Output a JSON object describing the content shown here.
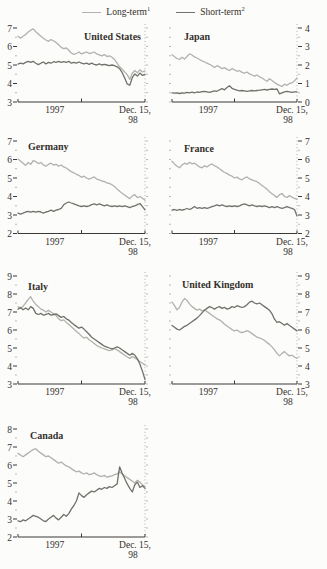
{
  "page": {
    "background": "#fcfcfa"
  },
  "legend": {
    "items": [
      {
        "label": "Long-term",
        "footnote": "1",
        "color": "#b2b1ae"
      },
      {
        "label": "Short-term",
        "footnote": "2",
        "color": "#72706b"
      }
    ]
  },
  "axis_labels": {
    "start": "1997",
    "end_line1": "Dec. 15,",
    "end_line2": "98"
  },
  "colors": {
    "long_term_line": "#b2b1ae",
    "short_term_line": "#72706b",
    "axis": "#3c3936",
    "dotted_guide": "#a8a7a4",
    "text": "#34302c"
  },
  "chart_data": [
    {
      "type": "line",
      "title": "United States",
      "axis_side": "left",
      "ylim": [
        3,
        7
      ],
      "yticks": [
        3,
        4,
        5,
        6,
        7
      ],
      "x_range": [
        "1997",
        "Dec. 15, 98"
      ],
      "series": [
        {
          "name": "Long-term",
          "values": [
            6.55,
            6.45,
            6.55,
            6.65,
            6.78,
            6.88,
            6.95,
            6.8,
            6.68,
            6.55,
            6.45,
            6.35,
            6.28,
            6.38,
            6.3,
            6.22,
            6.1,
            5.95,
            5.88,
            5.92,
            5.8,
            5.65,
            5.58,
            5.62,
            5.7,
            5.6,
            5.66,
            5.7,
            5.62,
            5.66,
            5.7,
            5.6,
            5.55,
            5.5,
            5.56,
            5.46,
            5.5,
            5.42,
            5.3,
            5.1,
            4.9,
            4.78,
            4.62,
            4.48,
            4.22,
            4.55,
            4.7,
            4.58,
            4.74,
            4.62,
            4.68
          ]
        },
        {
          "name": "Short-term",
          "values": [
            5.05,
            5.1,
            5.06,
            5.14,
            5.2,
            5.14,
            5.2,
            5.1,
            5.02,
            5.1,
            5.16,
            5.06,
            5.14,
            5.1,
            5.18,
            5.14,
            5.2,
            5.14,
            5.18,
            5.14,
            5.2,
            5.1,
            5.14,
            5.1,
            5.16,
            5.1,
            5.06,
            5.1,
            5.04,
            5.1,
            5.04,
            5.0,
            5.06,
            5.0,
            5.04,
            5.0,
            4.96,
            5.0,
            4.96,
            4.9,
            4.8,
            4.6,
            4.3,
            3.98,
            3.9,
            4.32,
            4.52,
            4.4,
            4.56,
            4.44,
            4.5
          ]
        }
      ]
    },
    {
      "type": "line",
      "title": "Japan",
      "axis_side": "right",
      "ylim": [
        0,
        4
      ],
      "yticks": [
        0,
        1,
        2,
        3,
        4
      ],
      "x_range": [
        "1997",
        "Dec. 15, 98"
      ],
      "series": [
        {
          "name": "Long-term",
          "values": [
            2.55,
            2.45,
            2.35,
            2.3,
            2.42,
            2.32,
            2.46,
            2.6,
            2.54,
            2.44,
            2.38,
            2.3,
            2.22,
            2.16,
            2.1,
            2.04,
            1.96,
            1.86,
            1.96,
            1.9,
            1.8,
            1.86,
            1.76,
            1.7,
            1.8,
            1.74,
            1.66,
            1.7,
            1.6,
            1.56,
            1.62,
            1.52,
            1.46,
            1.4,
            1.46,
            1.36,
            1.3,
            1.2,
            1.12,
            1.26,
            1.16,
            1.06,
            0.96,
            0.9,
            0.84,
            0.96,
            0.9,
            1.0,
            1.04,
            1.14,
            1.3
          ]
        },
        {
          "name": "Short-term",
          "values": [
            0.5,
            0.48,
            0.5,
            0.46,
            0.5,
            0.48,
            0.52,
            0.5,
            0.53,
            0.5,
            0.54,
            0.52,
            0.56,
            0.58,
            0.55,
            0.52,
            0.56,
            0.6,
            0.58,
            0.66,
            0.72,
            0.66,
            0.78,
            0.88,
            0.74,
            0.68,
            0.64,
            0.6,
            0.62,
            0.6,
            0.58,
            0.6,
            0.62,
            0.6,
            0.62,
            0.64,
            0.66,
            0.68,
            0.65,
            0.68,
            0.7,
            0.68,
            0.7,
            0.44,
            0.5,
            0.55,
            0.58,
            0.55,
            0.52,
            0.55,
            0.55
          ]
        }
      ]
    },
    {
      "type": "line",
      "title": "Germany",
      "axis_side": "left",
      "ylim": [
        2,
        7
      ],
      "yticks": [
        2,
        3,
        4,
        5,
        6,
        7
      ],
      "x_range": [
        "1997",
        "Dec. 15, 98"
      ],
      "series": [
        {
          "name": "Long-term",
          "values": [
            6.02,
            5.92,
            5.8,
            5.68,
            5.84,
            5.74,
            5.94,
            5.88,
            5.78,
            5.84,
            5.7,
            5.64,
            5.74,
            5.8,
            5.7,
            5.74,
            5.64,
            5.7,
            5.6,
            5.54,
            5.44,
            5.34,
            5.28,
            5.2,
            5.14,
            5.04,
            5.1,
            5.0,
            4.94,
            5.0,
            5.06,
            4.94,
            4.9,
            4.84,
            4.8,
            4.74,
            4.7,
            4.64,
            4.54,
            4.4,
            4.28,
            4.18,
            4.08,
            3.98,
            3.88,
            4.04,
            4.1,
            3.94,
            4.0,
            3.9,
            3.8
          ]
        },
        {
          "name": "Short-term",
          "values": [
            3.1,
            3.05,
            3.1,
            3.16,
            3.2,
            3.15,
            3.2,
            3.15,
            3.2,
            3.16,
            3.1,
            3.16,
            3.2,
            3.26,
            3.2,
            3.26,
            3.3,
            3.36,
            3.55,
            3.65,
            3.7,
            3.65,
            3.6,
            3.55,
            3.5,
            3.46,
            3.5,
            3.46,
            3.5,
            3.56,
            3.6,
            3.55,
            3.6,
            3.55,
            3.5,
            3.55,
            3.5,
            3.46,
            3.5,
            3.46,
            3.5,
            3.45,
            3.5,
            3.45,
            3.4,
            3.46,
            3.5,
            3.56,
            3.62,
            3.45,
            3.28
          ]
        }
      ]
    },
    {
      "type": "line",
      "title": "France",
      "axis_side": "right",
      "ylim": [
        2,
        7
      ],
      "yticks": [
        2,
        3,
        4,
        5,
        6,
        7
      ],
      "x_range": [
        "1997",
        "Dec. 15, 98"
      ],
      "series": [
        {
          "name": "Long-term",
          "values": [
            5.9,
            5.76,
            5.64,
            5.55,
            5.7,
            5.8,
            5.74,
            5.85,
            5.76,
            5.8,
            5.7,
            5.6,
            5.55,
            5.66,
            5.6,
            5.7,
            5.76,
            5.66,
            5.6,
            5.5,
            5.4,
            5.3,
            5.25,
            5.15,
            5.1,
            5.0,
            5.05,
            4.95,
            4.9,
            5.0,
            5.06,
            4.95,
            4.9,
            4.85,
            4.8,
            4.7,
            4.6,
            4.5,
            4.4,
            4.26,
            4.15,
            4.05,
            3.95,
            4.1,
            4.16,
            4.0,
            3.95,
            4.05,
            3.96,
            3.9,
            3.85
          ]
        },
        {
          "name": "Short-term",
          "values": [
            3.26,
            3.3,
            3.25,
            3.3,
            3.26,
            3.3,
            3.35,
            3.3,
            3.36,
            3.46,
            3.36,
            3.4,
            3.36,
            3.4,
            3.36,
            3.4,
            3.45,
            3.5,
            3.55,
            3.5,
            3.55,
            3.5,
            3.46,
            3.5,
            3.46,
            3.5,
            3.46,
            3.5,
            3.56,
            3.6,
            3.55,
            3.5,
            3.55,
            3.5,
            3.46,
            3.5,
            3.46,
            3.5,
            3.45,
            3.4,
            3.45,
            3.4,
            3.45,
            3.4,
            3.36,
            3.4,
            3.45,
            3.4,
            3.36,
            3.3,
            2.95
          ]
        }
      ]
    },
    {
      "type": "line",
      "title": "Italy",
      "axis_side": "left",
      "ylim": [
        3,
        9
      ],
      "yticks": [
        3,
        4,
        5,
        6,
        7,
        8,
        9
      ],
      "x_range": [
        "1997",
        "Dec. 15, 98"
      ],
      "series": [
        {
          "name": "Long-term",
          "values": [
            7.3,
            7.2,
            7.32,
            7.5,
            7.7,
            7.85,
            7.6,
            7.42,
            7.3,
            7.16,
            7.1,
            7.0,
            7.1,
            7.0,
            6.9,
            6.8,
            6.62,
            6.52,
            6.56,
            6.42,
            6.3,
            6.18,
            6.05,
            5.92,
            5.8,
            5.66,
            5.55,
            5.6,
            5.46,
            5.36,
            5.25,
            5.14,
            5.06,
            5.0,
            4.95,
            4.9,
            4.85,
            4.9,
            4.96,
            4.9,
            4.8,
            4.7,
            4.6,
            4.5,
            4.42,
            4.52,
            4.45,
            4.35,
            4.25,
            4.15,
            4.05
          ]
        },
        {
          "name": "Short-term",
          "values": [
            7.15,
            7.25,
            7.12,
            7.22,
            7.12,
            7.3,
            7.2,
            6.92,
            6.86,
            6.92,
            6.82,
            6.86,
            6.92,
            6.82,
            6.86,
            6.9,
            6.8,
            6.7,
            6.75,
            6.62,
            6.55,
            6.42,
            6.3,
            6.2,
            6.1,
            6.16,
            6.05,
            5.9,
            5.76,
            5.6,
            5.5,
            5.4,
            5.3,
            5.2,
            5.1,
            5.05,
            5.0,
            4.95,
            5.0,
            5.06,
            5.0,
            4.9,
            4.8,
            4.7,
            4.6,
            4.7,
            4.6,
            4.4,
            4.1,
            3.7,
            3.25
          ]
        }
      ]
    },
    {
      "type": "line",
      "title": "United Kingdom",
      "axis_side": "right",
      "ylim": [
        3,
        9
      ],
      "yticks": [
        3,
        4,
        5,
        6,
        7,
        8,
        9
      ],
      "x_range": [
        "1997",
        "Dec. 15, 98"
      ],
      "series": [
        {
          "name": "Long-term",
          "values": [
            7.55,
            7.35,
            7.12,
            7.25,
            7.55,
            7.75,
            7.65,
            7.45,
            7.3,
            7.2,
            7.1,
            7.16,
            7.06,
            7.12,
            7.02,
            6.92,
            6.82,
            6.72,
            6.62,
            6.56,
            6.46,
            6.32,
            6.22,
            6.12,
            6.02,
            5.95,
            6.0,
            5.9,
            5.86,
            5.9,
            5.96,
            5.9,
            5.8,
            5.7,
            5.6,
            5.56,
            5.5,
            5.42,
            5.3,
            5.2,
            5.06,
            4.9,
            4.7,
            4.56,
            4.7,
            4.8,
            4.66,
            4.56,
            4.6,
            4.5,
            4.42
          ]
        },
        {
          "name": "Short-term",
          "values": [
            6.25,
            6.15,
            6.05,
            6.0,
            6.1,
            6.2,
            6.26,
            6.36,
            6.46,
            6.56,
            6.66,
            6.8,
            6.95,
            7.1,
            7.2,
            7.3,
            7.24,
            7.16,
            7.25,
            7.3,
            7.2,
            7.26,
            7.16,
            7.2,
            7.3,
            7.25,
            7.35,
            7.3,
            7.25,
            7.3,
            7.4,
            7.55,
            7.6,
            7.5,
            7.45,
            7.5,
            7.4,
            7.3,
            7.2,
            7.1,
            6.9,
            6.6,
            6.42,
            6.46,
            6.36,
            6.26,
            6.36,
            6.25,
            6.15,
            6.05,
            5.95
          ]
        }
      ]
    },
    {
      "type": "line",
      "title": "Canada",
      "axis_side": "left",
      "ylim": [
        2,
        8
      ],
      "yticks": [
        2,
        3,
        4,
        5,
        6,
        7,
        8
      ],
      "x_range": [
        "1997",
        "Dec. 15, 98"
      ],
      "series": [
        {
          "name": "Long-term",
          "values": [
            6.65,
            6.55,
            6.46,
            6.56,
            6.66,
            6.76,
            6.86,
            6.9,
            6.76,
            6.66,
            6.56,
            6.46,
            6.5,
            6.4,
            6.3,
            6.2,
            6.1,
            6.16,
            6.05,
            5.95,
            5.9,
            5.8,
            5.7,
            5.62,
            5.66,
            5.56,
            5.5,
            5.56,
            5.46,
            5.5,
            5.56,
            5.46,
            5.4,
            5.36,
            5.42,
            5.32,
            5.36,
            5.4,
            5.46,
            5.5,
            5.62,
            5.5,
            5.4,
            5.3,
            5.2,
            5.1,
            5.0,
            5.15,
            5.05,
            4.9,
            4.8
          ]
        },
        {
          "name": "Short-term",
          "values": [
            2.9,
            2.85,
            2.95,
            2.9,
            3.0,
            3.1,
            3.2,
            3.15,
            3.1,
            3.0,
            2.9,
            2.86,
            3.0,
            3.1,
            3.2,
            3.05,
            2.95,
            3.1,
            3.25,
            3.15,
            3.3,
            3.55,
            3.75,
            4.0,
            4.45,
            4.3,
            4.2,
            4.35,
            4.45,
            4.55,
            4.5,
            4.6,
            4.7,
            4.65,
            4.75,
            4.7,
            4.8,
            4.75,
            4.85,
            4.95,
            5.9,
            5.55,
            5.25,
            4.95,
            4.7,
            4.5,
            4.9,
            5.05,
            4.75,
            4.85,
            4.7
          ]
        }
      ]
    }
  ]
}
